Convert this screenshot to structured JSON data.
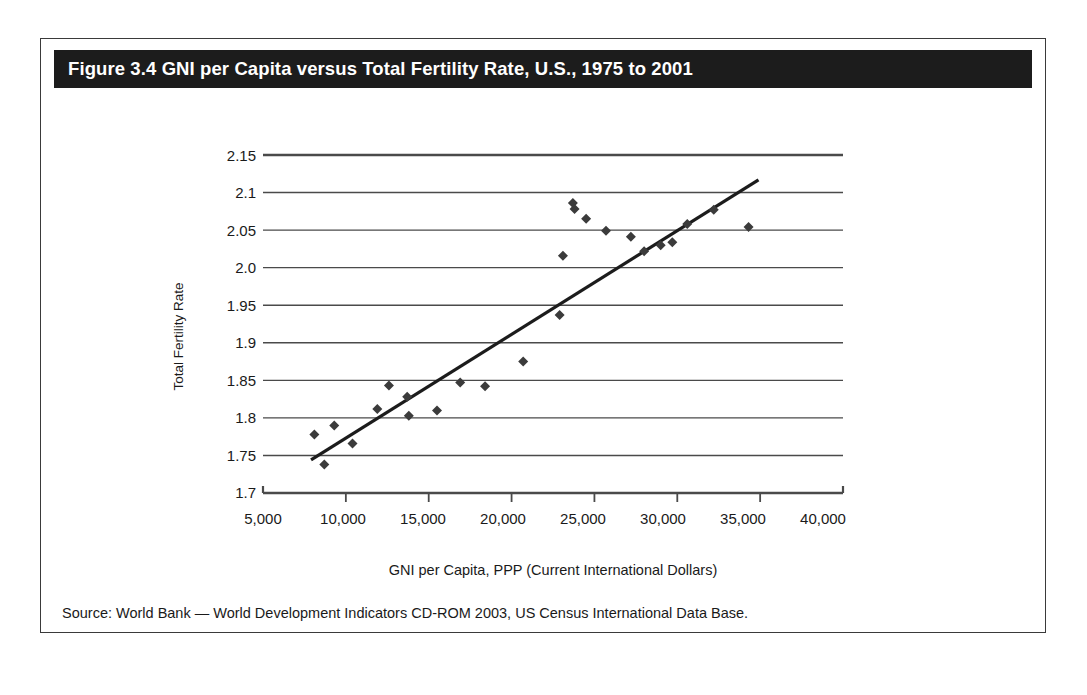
{
  "figure": {
    "title": "Figure 3.4 GNI per Capita versus Total Fertility Rate, U.S., 1975 to 2001",
    "source_note": "Source: World Bank — World Development Indicators CD-ROM 2003, US Census International Data Base.",
    "banner_color": "#1c1c1c",
    "border_color": "#3a3a3a",
    "marker_color": "#3b3b3b",
    "trendline_color": "#1c1c1c",
    "gridline_color": "#4a4a4a"
  },
  "chart_data": {
    "type": "scatter",
    "title": "Figure 3.4 GNI per Capita versus Total Fertility Rate, U.S., 1975 to 2001",
    "xlabel": "GNI per Capita, PPP (Current International Dollars)",
    "ylabel": "Total Fertility Rate",
    "xlim": [
      5000,
      40000
    ],
    "ylim": [
      1.7,
      2.15
    ],
    "xticks": [
      5000,
      10000,
      15000,
      20000,
      25000,
      30000,
      35000,
      40000
    ],
    "xticklabels": [
      "5,000",
      "10,000",
      "15,000",
      "20,000",
      "25,000",
      "30,000",
      "35,000",
      "40,000"
    ],
    "yticks": [
      1.7,
      1.75,
      1.8,
      1.85,
      1.9,
      1.95,
      2.0,
      2.05,
      2.1,
      2.15
    ],
    "yticklabels": [
      "1.7",
      "1.75",
      "1.8",
      "1.85",
      "1.9",
      "1.95",
      "2.0",
      "2.05",
      "2.1",
      "2.15"
    ],
    "grid": "horizontal",
    "legend": "none",
    "series": [
      {
        "name": "United States, 1975 to 2001",
        "marker": "diamond",
        "points": [
          {
            "x": 8100,
            "y": 1.778
          },
          {
            "x": 8700,
            "y": 1.738
          },
          {
            "x": 9300,
            "y": 1.79
          },
          {
            "x": 10400,
            "y": 1.766
          },
          {
            "x": 11900,
            "y": 1.812
          },
          {
            "x": 12600,
            "y": 1.843
          },
          {
            "x": 13700,
            "y": 1.828
          },
          {
            "x": 13800,
            "y": 1.803
          },
          {
            "x": 15500,
            "y": 1.81
          },
          {
            "x": 16900,
            "y": 1.847
          },
          {
            "x": 18400,
            "y": 1.842
          },
          {
            "x": 20700,
            "y": 1.875
          },
          {
            "x": 22900,
            "y": 1.937
          },
          {
            "x": 23100,
            "y": 2.016
          },
          {
            "x": 23700,
            "y": 2.086
          },
          {
            "x": 23800,
            "y": 2.078
          },
          {
            "x": 24500,
            "y": 2.065
          },
          {
            "x": 25700,
            "y": 2.049
          },
          {
            "x": 27200,
            "y": 2.041
          },
          {
            "x": 28000,
            "y": 2.022
          },
          {
            "x": 29000,
            "y": 2.03
          },
          {
            "x": 29700,
            "y": 2.034
          },
          {
            "x": 30600,
            "y": 2.058
          },
          {
            "x": 32200,
            "y": 2.077
          },
          {
            "x": 34300,
            "y": 2.054
          }
        ]
      }
    ],
    "trendline": {
      "type": "linear-fit",
      "x_start": 7900,
      "y_start": 1.744,
      "x_end": 34900,
      "y_end": 2.117
    }
  },
  "axis_labels": {
    "y": [
      "2.15",
      "2.1",
      "2.05",
      "2.0",
      "1.95",
      "1.9",
      "1.85",
      "1.8",
      "1.75",
      "1.7"
    ],
    "x": [
      "5,000",
      "10,000",
      "15,000",
      "20,000",
      "25,000",
      "30,000",
      "35,000",
      "40,000"
    ]
  }
}
